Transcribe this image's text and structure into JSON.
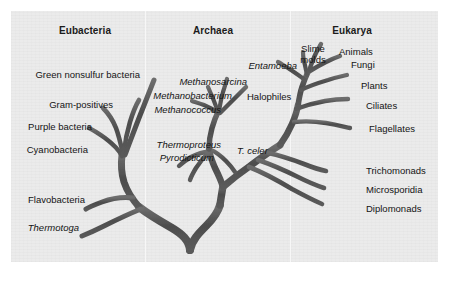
{
  "figure": {
    "kind": "phylogenetic-tree",
    "background_color": "#ebebeb",
    "page_color": "#ffffff",
    "branch_color": "#4a4a4a",
    "text_color": "#141414"
  },
  "headers": [
    {
      "label": "Eubacteria",
      "x": 85,
      "y": 25
    },
    {
      "label": "Archaea",
      "x": 213,
      "y": 25
    },
    {
      "label": "Eukarya",
      "x": 352,
      "y": 25
    }
  ],
  "domains": {
    "eubacteria": {
      "name": "Eubacteria",
      "taxa": [
        {
          "label": "Green nonsulfur bacteria",
          "italic": false,
          "x": 140,
          "y": 69,
          "align": "right"
        },
        {
          "label": "Gram-positives",
          "italic": false,
          "x": 113,
          "y": 99,
          "align": "right"
        },
        {
          "label": "Purple bacteria",
          "italic": false,
          "x": 92,
          "y": 121,
          "align": "right"
        },
        {
          "label": "Cyanobacteria",
          "italic": false,
          "x": 88,
          "y": 144,
          "align": "right"
        },
        {
          "label": "Flavobacteria",
          "italic": false,
          "x": 85,
          "y": 194,
          "align": "right"
        },
        {
          "label": "Thermotoga",
          "italic": true,
          "x": 79,
          "y": 222,
          "align": "right"
        }
      ]
    },
    "archaea": {
      "name": "Archaea",
      "taxa": [
        {
          "label": "Methanosarcina",
          "italic": true,
          "x": 247,
          "y": 76,
          "align": "right"
        },
        {
          "label": "Methanobacterium",
          "italic": true,
          "x": 232,
          "y": 90,
          "align": "right"
        },
        {
          "label": "Methanococcus",
          "italic": true,
          "x": 221,
          "y": 104,
          "align": "right"
        },
        {
          "label": "Halophiles",
          "italic": false,
          "x": 247,
          "y": 91,
          "align": "left"
        },
        {
          "label": "Thermoproteus",
          "italic": true,
          "x": 221,
          "y": 139,
          "align": "right"
        },
        {
          "label": "Pyrodicticum",
          "italic": true,
          "x": 214,
          "y": 152,
          "align": "right"
        },
        {
          "label": "T. celer",
          "italic": true,
          "x": 237,
          "y": 145,
          "align": "left"
        }
      ]
    },
    "eukarya": {
      "name": "Eukarya",
      "taxa": [
        {
          "label": "Entamoeba",
          "italic": true,
          "x": 297,
          "y": 60,
          "align": "right"
        },
        {
          "label": "Slime",
          "italic": false,
          "x": 313,
          "y": 43,
          "align": "center"
        },
        {
          "label": "molds",
          "italic": false,
          "x": 313,
          "y": 54,
          "align": "center"
        },
        {
          "label": "Animals",
          "italic": false,
          "x": 339,
          "y": 46,
          "align": "left"
        },
        {
          "label": "Fungi",
          "italic": false,
          "x": 351,
          "y": 59,
          "align": "left"
        },
        {
          "label": "Plants",
          "italic": false,
          "x": 361,
          "y": 80,
          "align": "left"
        },
        {
          "label": "Ciliates",
          "italic": false,
          "x": 366,
          "y": 100,
          "align": "left"
        },
        {
          "label": "Flagellates",
          "italic": false,
          "x": 369,
          "y": 123,
          "align": "left"
        },
        {
          "label": "Trichomonads",
          "italic": false,
          "x": 366,
          "y": 165,
          "align": "left"
        },
        {
          "label": "Microsporidia",
          "italic": false,
          "x": 366,
          "y": 184,
          "align": "left"
        },
        {
          "label": "Diplomonads",
          "italic": false,
          "x": 366,
          "y": 203,
          "align": "left"
        }
      ]
    }
  }
}
